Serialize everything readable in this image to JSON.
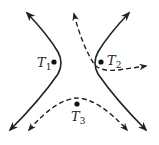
{
  "diagram": {
    "type": "hyperbola-trajectories",
    "colors": {
      "stroke": "#222222",
      "background": "#ffffff"
    },
    "points": [
      {
        "id": "T1",
        "label": "T",
        "subscript": "1",
        "x": 54,
        "y": 62
      },
      {
        "id": "T2",
        "label": "T",
        "subscript": "2",
        "x": 101,
        "y": 62
      },
      {
        "id": "T3",
        "label": "T",
        "subscript": "3",
        "x": 77,
        "y": 104
      }
    ],
    "curves": [
      {
        "id": "left-branch",
        "style": "solid",
        "arrows": "both"
      },
      {
        "id": "right-branch",
        "style": "solid",
        "arrows": "both"
      },
      {
        "id": "dashed-path-top",
        "style": "dashed",
        "arrows": "both"
      },
      {
        "id": "dashed-path-bottom",
        "style": "dashed",
        "arrows": "both"
      }
    ]
  }
}
